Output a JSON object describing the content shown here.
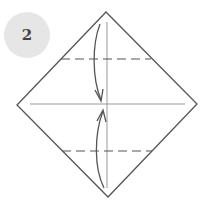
{
  "step": {
    "number": "2",
    "badge_color": "#e6e6e6",
    "text_color": "#444444"
  },
  "diagram": {
    "type": "origami-fold-instruction",
    "square": {
      "top": [
        106,
        12
      ],
      "right": [
        197,
        104
      ],
      "bottom": [
        108,
        197
      ],
      "left": [
        17,
        105
      ]
    },
    "crease_horizontal": {
      "x1": 30,
      "y": 104,
      "x2": 185
    },
    "crease_vertical": {
      "x": 107,
      "y1": 22,
      "y2": 188
    },
    "valley_fold_top": {
      "x1": 61,
      "x2": 151,
      "y": 59
    },
    "valley_fold_bottom": {
      "x1": 62,
      "x2": 152,
      "y": 151
    },
    "arrows": [
      {
        "name": "fold-top-down-arrow",
        "direction": "down"
      },
      {
        "name": "fold-bottom-up-arrow",
        "direction": "up"
      }
    ],
    "line_color": "#555555",
    "crease_color": "#999999"
  }
}
